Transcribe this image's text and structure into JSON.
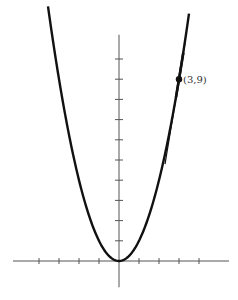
{
  "chart_data": {
    "type": "line",
    "title": "",
    "xlabel": "",
    "ylabel": "",
    "grid": false,
    "series": [
      {
        "name": "y = x^2",
        "function": "x^2",
        "x_range": [
          -3.55,
          3.5
        ]
      },
      {
        "name": "tangent at (3,9)",
        "function": "6x - 9",
        "x_range": [
          2.3,
          3.3
        ]
      }
    ],
    "points": [
      {
        "x": 3,
        "y": 9,
        "label": "(3,9)"
      }
    ],
    "xlim": [
      -5.3,
      5.5
    ],
    "ylim": [
      -1.3,
      11.2
    ],
    "x_ticks": [
      -4,
      -3,
      -2,
      -1,
      1,
      2,
      3,
      4
    ],
    "y_ticks": [
      1,
      2,
      3,
      4,
      5,
      6,
      7,
      8,
      9,
      10
    ]
  },
  "annotation": {
    "point_label": "(3,9)"
  }
}
